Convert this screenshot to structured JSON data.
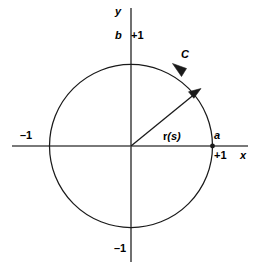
{
  "figure": {
    "colors": {
      "background": "#ffffff",
      "stroke": "#1a1a1a",
      "axis": "#555555",
      "text": "#000000"
    },
    "geometry": {
      "center_x": 131,
      "center_y": 146,
      "radius": 81,
      "x_axis_y": 146,
      "x_axis_from": 12,
      "x_axis_to": 248,
      "y_axis_x": 131,
      "y_axis_from": 8,
      "y_axis_to": 262,
      "vector_angle_deg": 34,
      "vector_tip_x": 199,
      "vector_tip_y": 91,
      "curve_arrow_angle_deg": 104,
      "point_a_x": 212,
      "point_a_y": 146
    }
  },
  "axes": {
    "x_label": "x",
    "y_label": "y",
    "ticks": {
      "x_positive": "+1",
      "x_negative": "–1",
      "y_positive": "+1",
      "y_negative": "–1"
    }
  },
  "annotations": {
    "curve_label": "C",
    "vector_label_bold": "r",
    "vector_label_arg": "(s)",
    "vector_label_full": "r(s)",
    "point_a": "a",
    "point_b": "b"
  },
  "icons": {
    "vector_arrowhead": "arrow-head-icon",
    "curve_arrowhead": "curve-direction-arrow-icon",
    "point_marker": "point-dot-icon"
  }
}
